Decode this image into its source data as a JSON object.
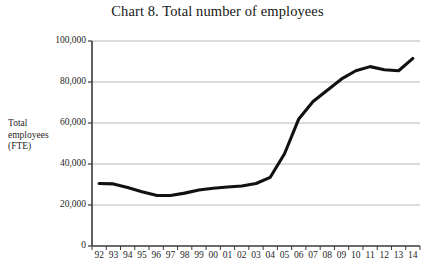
{
  "chart_data": {
    "type": "line",
    "title": "Chart 8. Total number of employees",
    "xlabel": "",
    "ylabel": "Total employees (FTE)",
    "ylabel_lines": [
      "Total",
      "employees",
      "(FTE)"
    ],
    "grid": true,
    "legend": "none",
    "ylim": [
      0,
      100000
    ],
    "yticks": [
      0,
      20000,
      40000,
      60000,
      80000,
      100000
    ],
    "ytick_labels": [
      "0",
      "20,000",
      "40,000",
      "60,000",
      "80,000",
      "100,000"
    ],
    "categories": [
      "92",
      "93",
      "94",
      "95",
      "96",
      "97",
      "98",
      "99",
      "00",
      "01",
      "02",
      "03",
      "04",
      "05",
      "06",
      "07",
      "08",
      "09",
      "10",
      "11",
      "12",
      "13",
      "14"
    ],
    "values": [
      30500,
      30300,
      28500,
      26500,
      24700,
      24600,
      25800,
      27300,
      28200,
      28800,
      29300,
      30500,
      33500,
      45000,
      62000,
      70500,
      76000,
      81500,
      85500,
      87500,
      86000,
      85500,
      91500
    ],
    "series_name": "Total employees (FTE)",
    "line_color": "#111111",
    "grid_color": "#b8b8b8",
    "axis_color": "#3a3a3a"
  },
  "layout": {
    "plot_left": 92,
    "plot_right": 420,
    "plot_top": 41,
    "plot_bottom": 246
  }
}
